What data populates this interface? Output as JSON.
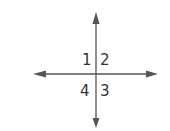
{
  "diagram": {
    "type": "intersecting-lines-angles",
    "angle_labels": {
      "top_left": "1",
      "top_right": "2",
      "bottom_right": "3",
      "bottom_left": "4"
    },
    "line_color": "#555555"
  }
}
